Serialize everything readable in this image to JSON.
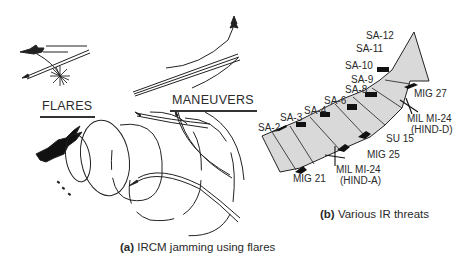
{
  "panel_a": {
    "flares_label": "FLARES",
    "maneuvers_label": "MANEUVERS",
    "caption_letter": "(a)",
    "caption_text": " IRCM jamming using flares"
  },
  "panel_b": {
    "caption_letter": "(b)",
    "caption_text": " Various IR threats",
    "missile_labels": [
      "SA-2",
      "SA-3",
      "SA-4",
      "SA-6",
      "SA-8",
      "SA-9",
      "SA-10",
      "SA-11",
      "SA-12"
    ],
    "aircraft_labels": {
      "mig21": "MIG 21",
      "hind_a_1": "MIL MI-24",
      "hind_a_2": "(HIND-A)",
      "mig25": "MIG 25",
      "su15": "SU 15",
      "hind_d_1": "MIL MI-24",
      "hind_d_2": "(HIND-D)",
      "mig27": "MIG 27"
    }
  },
  "colors": {
    "ink": "#222222",
    "arrow_fill": "#d9d9d9",
    "background": "#ffffff"
  }
}
